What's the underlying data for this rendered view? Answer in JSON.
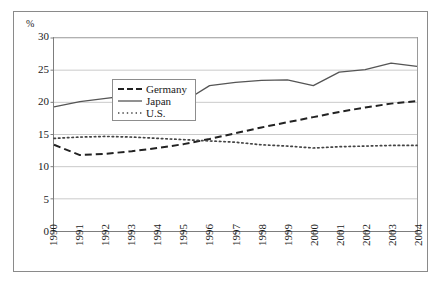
{
  "chart_data": {
    "type": "line",
    "title": "",
    "subtitle": "",
    "xlabel": "",
    "ylabel": "%",
    "unit_label": "%",
    "categories": [
      "1990",
      "1991",
      "1992",
      "1993",
      "1994",
      "1995",
      "1996",
      "1997",
      "1998",
      "1999",
      "2000",
      "2001",
      "2002",
      "2003",
      "2004"
    ],
    "x": [
      1990,
      1991,
      1992,
      1993,
      1994,
      1995,
      1996,
      1997,
      1998,
      1999,
      2000,
      2001,
      2002,
      2003,
      2004
    ],
    "ylim": [
      0,
      30
    ],
    "xlim": [
      1990,
      2004
    ],
    "yticks": [
      0,
      5,
      10,
      15,
      20,
      25,
      30
    ],
    "ytick_labels": [
      "0",
      "5",
      "10",
      "15",
      "20",
      "25",
      "30"
    ],
    "grid": true,
    "grid_axis": "y",
    "legend_position": "top-left-inside",
    "series": [
      {
        "name": "Germany",
        "style": "dashed",
        "color": "#222222",
        "values": [
          13.4,
          11.8,
          12.0,
          12.4,
          12.9,
          13.5,
          14.3,
          15.2,
          16.1,
          16.9,
          17.7,
          18.5,
          19.2,
          19.8,
          20.2
        ]
      },
      {
        "name": "Japan",
        "style": "solid",
        "color": "#555555",
        "values": [
          19.3,
          20.1,
          20.6,
          21.1,
          21.3,
          20.1,
          22.6,
          23.1,
          23.4,
          23.5,
          22.6,
          24.7,
          25.1,
          26.1,
          25.6
        ]
      },
      {
        "name": "U.S.",
        "style": "dotted",
        "color": "#444444",
        "values": [
          14.4,
          14.6,
          14.7,
          14.6,
          14.4,
          14.2,
          14.0,
          13.8,
          13.4,
          13.2,
          12.9,
          13.1,
          13.2,
          13.3,
          13.3
        ]
      }
    ]
  },
  "legend": {
    "entries": [
      {
        "label": "Germany"
      },
      {
        "label": "Japan"
      },
      {
        "label": "U.S."
      }
    ]
  }
}
